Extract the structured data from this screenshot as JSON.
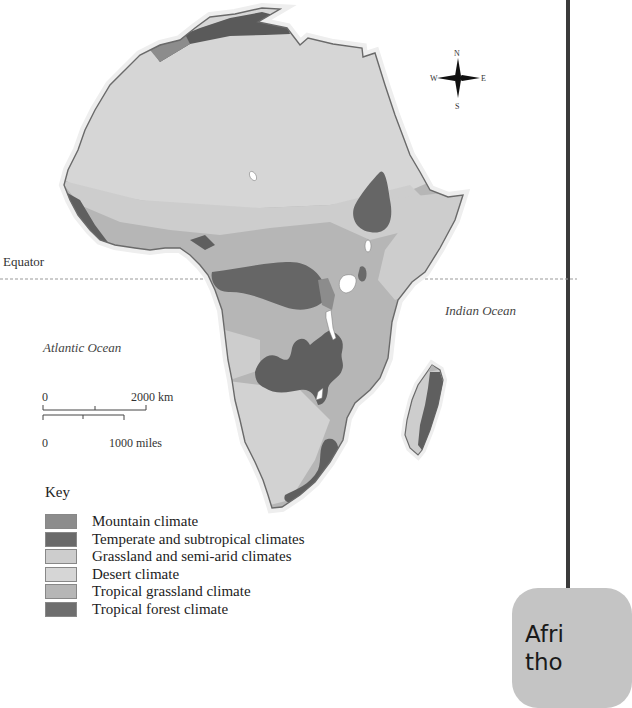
{
  "map": {
    "equator_label": "Equator",
    "oceans": {
      "atlantic": "Atlantic Ocean",
      "indian": "Indian Ocean"
    },
    "compass": {
      "n": "N",
      "s": "S",
      "e": "E",
      "w": "W"
    },
    "scale": {
      "km_start": "0",
      "km_end": "2000 km",
      "miles_start": "0",
      "miles_end": "1000 miles"
    }
  },
  "key": {
    "title": "Key",
    "items": [
      {
        "label": "Mountain climate",
        "color": "#8c8c8c"
      },
      {
        "label": "Temperate and subtropical climates",
        "color": "#6a6a6a"
      },
      {
        "label": "Grassland and semi-arid climates",
        "color": "#cdcdcd"
      },
      {
        "label": "Desert climate",
        "color": "#d6d6d6"
      },
      {
        "label": "Tropical grassland climate",
        "color": "#b6b6b6"
      },
      {
        "label": "Tropical forest climate",
        "color": "#6e6e6e"
      }
    ]
  },
  "callout": {
    "line1": "Afri",
    "line2": "tho"
  },
  "colors": {
    "coast": "#6a6a6a",
    "desert": "#d6d6d6",
    "grassland_semiarid": "#cdcdcd",
    "tropical_grassland": "#b6b6b6",
    "tropical_forest": "#666666",
    "temperate": "#5f5f5f",
    "mountain": "#8c8c8c",
    "frame": "#3a3a3a",
    "callout_bg": "#c4c4c4"
  }
}
